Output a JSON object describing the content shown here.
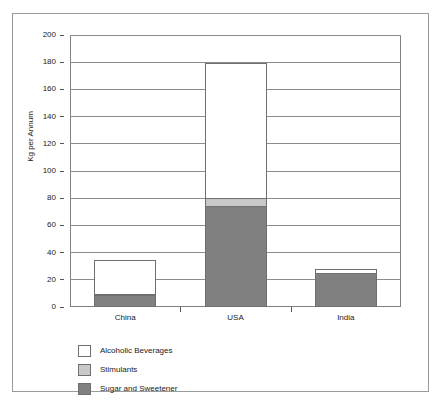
{
  "chart_data": {
    "type": "bar",
    "subtype": "stacked-bar",
    "title": "",
    "xlabel": "",
    "ylabel": "Kg per Annum",
    "ylim": [
      0,
      200
    ],
    "ytick_step": 20,
    "ytick_labels": [
      "200",
      "180",
      "160",
      "140",
      "120",
      "100",
      "80",
      "60",
      "40",
      "20",
      "0"
    ],
    "grid": true,
    "legend_position": "bottom-left",
    "categories": [
      "China",
      "USA",
      "India"
    ],
    "series": [
      {
        "name": "Alcoholic Beverages",
        "color": "#ffffff",
        "values": [
          26,
          100,
          3
        ]
      },
      {
        "name": "Stimulants",
        "color": "#c8c8c8",
        "values": [
          0.5,
          7,
          1
        ]
      },
      {
        "name": "Sugar and Sweetener",
        "color": "#808080",
        "values": [
          9,
          74,
          25
        ]
      }
    ],
    "totals": [
      35,
      181,
      29
    ]
  },
  "axis": {
    "y_title": "Kg per Annum",
    "ticks": [
      {
        "label": "200",
        "value": 200
      },
      {
        "label": "180",
        "value": 180
      },
      {
        "label": "160",
        "value": 160
      },
      {
        "label": "140",
        "value": 140
      },
      {
        "label": "120",
        "value": 120
      },
      {
        "label": "100",
        "value": 100
      },
      {
        "label": "80",
        "value": 80
      },
      {
        "label": "60",
        "value": 60
      },
      {
        "label": "40",
        "value": 40
      },
      {
        "label": "20",
        "value": 20
      },
      {
        "label": "0",
        "value": 0
      }
    ]
  },
  "categories": [
    {
      "label": "China"
    },
    {
      "label": "USA"
    },
    {
      "label": "India"
    }
  ],
  "legend": [
    {
      "label": "Alcoholic Beverages",
      "color": "#ffffff"
    },
    {
      "label": "Stimulants",
      "color": "#c8c8c8"
    },
    {
      "label": "Sugar and Sweetener",
      "color": "#808080"
    }
  ],
  "colors": {
    "alcoholic_beverages": "#ffffff",
    "stimulants": "#c8c8c8",
    "sugar_and_sweetener": "#808080",
    "axis": "#808080",
    "grid": "#8c8c8c",
    "frame": "#9a9a9a"
  }
}
